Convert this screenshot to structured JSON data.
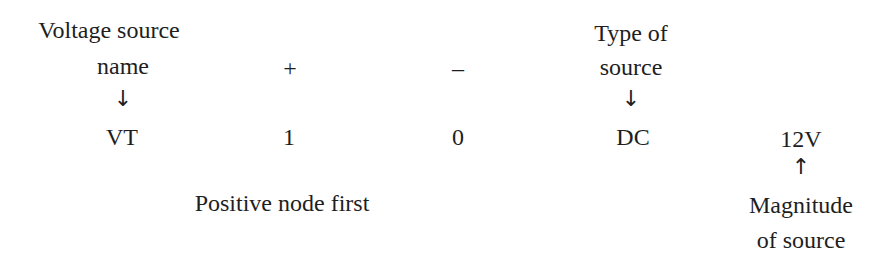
{
  "diagram": {
    "labels": {
      "voltage_source_name_line1": "Voltage source",
      "voltage_source_name_line2": "name",
      "plus": "+",
      "minus": "–",
      "type_of_source_line1": "Type of",
      "type_of_source_line2": "source",
      "positive_node_first": "Positive node first",
      "magnitude_line1": "Magnitude",
      "magnitude_line2": "of source"
    },
    "arrows": {
      "down": "↓",
      "up": "↑"
    },
    "statement": {
      "name": "VT",
      "positive_node": "1",
      "negative_node": "0",
      "type": "DC",
      "magnitude": "12V"
    }
  }
}
